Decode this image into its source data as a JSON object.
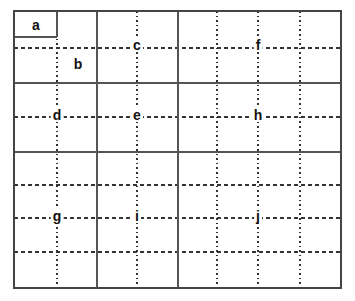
{
  "diagram": {
    "canvas": {
      "width": 355,
      "height": 301,
      "background": "#ffffff"
    },
    "frame": {
      "x1": 14,
      "y1": 11,
      "x2": 341,
      "y2": 288,
      "stroke": "#444444",
      "stroke_width": 1.6,
      "style": "solid"
    },
    "solid_lines": {
      "stroke": "#555555",
      "stroke_width": 1.6,
      "verticals": [
        97,
        178
      ],
      "horizontals": [
        83,
        152
      ],
      "partial": [
        {
          "orientation": "vertical",
          "x": 57,
          "y1": 11,
          "y2": 37
        },
        {
          "orientation": "horizontal",
          "y": 37,
          "x1": 14,
          "x2": 57
        }
      ]
    },
    "dashed_lines": {
      "stroke": "#333333",
      "stroke_width": 1.3,
      "dash_pattern": "4,3",
      "dot_pattern": "1.6,3",
      "verticals": [
        57,
        137,
        217,
        258,
        300
      ],
      "horizontals": [
        48,
        117,
        185,
        218,
        252
      ]
    },
    "labels": [
      {
        "id": "a",
        "text": "a",
        "x": 36,
        "y": 25
      },
      {
        "id": "b",
        "text": "b",
        "x": 78,
        "y": 64
      },
      {
        "id": "c",
        "text": "c",
        "x": 137,
        "y": 45
      },
      {
        "id": "d",
        "text": "d",
        "x": 57,
        "y": 115
      },
      {
        "id": "e",
        "text": "e",
        "x": 137,
        "y": 115
      },
      {
        "id": "f",
        "text": "f",
        "x": 258,
        "y": 45
      },
      {
        "id": "g",
        "text": "g",
        "x": 57,
        "y": 216
      },
      {
        "id": "h",
        "text": "h",
        "x": 258,
        "y": 115
      },
      {
        "id": "i",
        "text": "i",
        "x": 137,
        "y": 216
      },
      {
        "id": "j",
        "text": "j",
        "x": 258,
        "y": 216
      }
    ]
  }
}
